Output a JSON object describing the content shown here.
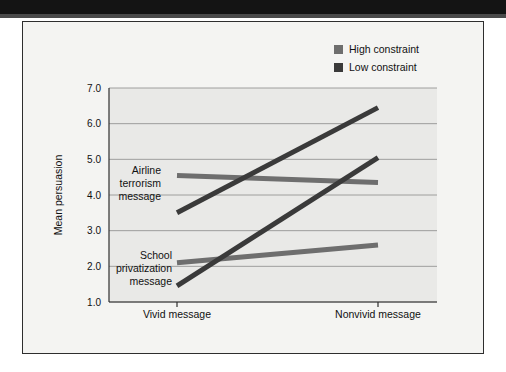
{
  "page": {
    "background_color": "#ffffff",
    "header_band_color": "#141414",
    "card_background_color": "#f4f4f2",
    "card_border_color": "#2e2e2e"
  },
  "legend": {
    "position": "top-right",
    "items": [
      {
        "label": "High constraint",
        "color": "#6e6e6e",
        "swatch_icon": "square-swatch-icon"
      },
      {
        "label": "Low constraint",
        "color": "#3a3a3a",
        "swatch_icon": "square-swatch-icon"
      }
    ]
  },
  "annotations": [
    {
      "id": "airline",
      "lines": [
        "Airline",
        "terrorism",
        "message"
      ]
    },
    {
      "id": "school",
      "lines": [
        "School",
        "privatization",
        "message"
      ]
    }
  ],
  "chart_data": {
    "type": "line",
    "title": "",
    "xlabel": "",
    "ylabel": "Mean persuasion",
    "categories": [
      "Vivid message",
      "Nonvivid message"
    ],
    "ylim": [
      1.0,
      7.0
    ],
    "ytick_labels": [
      "1.0",
      "2.0",
      "3.0",
      "4.0",
      "5.0",
      "6.0",
      "7.0"
    ],
    "yticks": [
      1.0,
      2.0,
      3.0,
      4.0,
      5.0,
      6.0,
      7.0
    ],
    "grid": true,
    "grid_axis": "y",
    "legend_position": "top-right",
    "series": [
      {
        "name": "Airline terrorism message — High constraint",
        "group": "Airline terrorism message",
        "constraint": "High constraint",
        "color": "#6e6e6e",
        "values": [
          4.55,
          4.35
        ]
      },
      {
        "name": "Airline terrorism message — Low constraint",
        "group": "Airline terrorism message",
        "constraint": "Low constraint",
        "color": "#3a3a3a",
        "values": [
          3.5,
          6.45
        ]
      },
      {
        "name": "School privatization message — High constraint",
        "group": "School privatization message",
        "constraint": "High constraint",
        "color": "#6e6e6e",
        "values": [
          2.1,
          2.6
        ]
      },
      {
        "name": "School privatization message — Low constraint",
        "group": "School privatization message",
        "constraint": "Low constraint",
        "color": "#3a3a3a",
        "values": [
          1.45,
          5.05
        ]
      }
    ]
  }
}
